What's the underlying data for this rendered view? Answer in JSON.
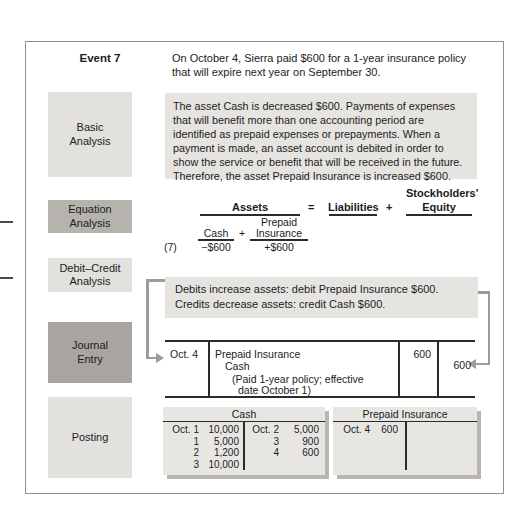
{
  "figure": {
    "event": {
      "label": "Event 7",
      "description": "On October 4, Sierra paid $600 for a 1-year insurance policy that will expire next year on September 30."
    },
    "basic_analysis": {
      "label": "Basic\nAnalysis",
      "text": "The asset Cash is decreased $600. Payments of expenses that will benefit more than one accounting period are identified as prepaid expenses or prepayments. When a payment is made, an asset account is debited in order to show the service or benefit that will be received in the future. Therefore, the asset Prepaid Insurance is increased $600."
    },
    "equation_analysis": {
      "label": "Equation\nAnalysis",
      "assets": "Assets",
      "equals": "=",
      "liabilities": "Liabilities",
      "plus_top": "+",
      "stockholders": "Stockholders'",
      "equity": "Equity",
      "cash": "Cash",
      "plus_inner": "+",
      "prepaid_line1": "Prepaid",
      "prepaid_line2": "Insurance",
      "txn_number": "(7)",
      "cash_amount": "−$600",
      "prepaid_amount": "+$600"
    },
    "debit_credit_analysis": {
      "label": "Debit–Credit\nAnalysis",
      "line1": "Debits increase assets: debit Prepaid Insurance $600.",
      "line2": "Credits decrease assets: credit Cash $600."
    },
    "journal_entry": {
      "label": "Journal\nEntry",
      "date": "Oct. 4",
      "debit_account": "Prepaid Insurance",
      "credit_account": "Cash",
      "memo_line1": "(Paid 1-year policy; effective",
      "memo_line2": "date October 1)",
      "debit_amount": "600",
      "credit_amount": "600"
    },
    "posting": {
      "label": "Posting",
      "cash_account": {
        "title": "Cash",
        "debit_entries": [
          {
            "date": "Oct. 1",
            "amount": "10,000"
          },
          {
            "date": "1",
            "amount": "5,000"
          },
          {
            "date": "2",
            "amount": "1,200"
          },
          {
            "date": "3",
            "amount": "10,000"
          }
        ],
        "credit_entries": [
          {
            "date": "Oct. 2",
            "amount": "5,000"
          },
          {
            "date": "3",
            "amount": "900"
          },
          {
            "date": "4",
            "amount": "600"
          }
        ]
      },
      "prepaid_account": {
        "title": "Prepaid Insurance",
        "debit_entries": [
          {
            "date": "Oct. 4",
            "amount": "600"
          }
        ],
        "credit_entries": []
      }
    }
  },
  "colors": {
    "label_light": "#e3e1dd",
    "label_medium": "#b6b3ae",
    "label_dark": "#a8a5a0",
    "panel_background": "#e6e4e0",
    "taccount_background": "#e8e6e2",
    "taccount_shadow": "#b9b6b1",
    "arrow": "#9c9c9c",
    "rule": "#2b2b2b",
    "outer_border": "#8f8f8f",
    "text": "#1c1c1c"
  }
}
